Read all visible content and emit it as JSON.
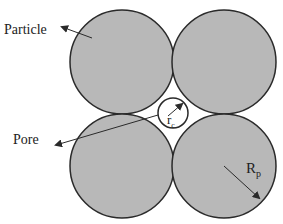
{
  "diagram": {
    "labels": {
      "particle": "Particle",
      "pore": "Pore",
      "pore_radius_main": "r",
      "pore_radius_sub": "c",
      "particle_radius_main": "R",
      "particle_radius_sub": "p"
    },
    "colors": {
      "particle_fill": "#b8b8b8",
      "outline": "#2a2a2a",
      "background": "#ffffff"
    }
  }
}
